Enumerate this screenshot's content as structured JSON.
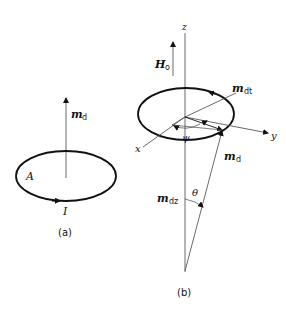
{
  "panel_a": {
    "caption": "(a)",
    "moment_label": "m",
    "moment_sub": "d",
    "area_label": "A",
    "current_label": "I"
  },
  "panel_b": {
    "caption": "(b)",
    "z_axis_label": "z",
    "x_axis_label": "x",
    "y_axis_label": "y",
    "field_label": "H",
    "field_sub": "o",
    "transverse_label": "m",
    "transverse_sub": "dt",
    "moment_label": "m",
    "moment_sub": "d",
    "axial_label": "m",
    "axial_sub": "dz",
    "theta_label": "θ",
    "psi_label": "ψ"
  },
  "colors": {
    "stroke": "#111111",
    "thin_stroke": "#444444"
  }
}
